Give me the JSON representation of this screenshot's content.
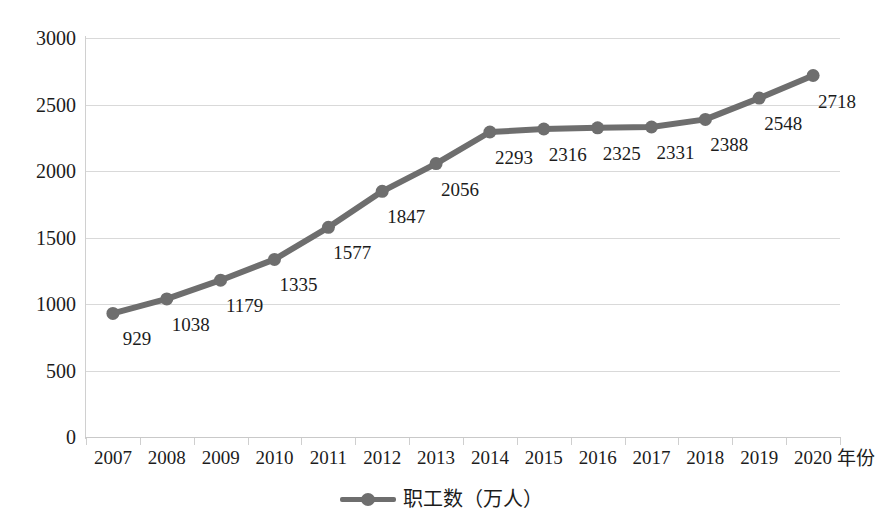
{
  "chart_data": {
    "type": "line",
    "title": "",
    "xlabel": "年份",
    "ylabel": "",
    "categories": [
      "2007",
      "2008",
      "2009",
      "2010",
      "2011",
      "2012",
      "2013",
      "2014",
      "2015",
      "2016",
      "2017",
      "2018",
      "2019",
      "2020"
    ],
    "values": [
      929,
      1038,
      1179,
      1335,
      1577,
      1847,
      2056,
      2293,
      2316,
      2325,
      2331,
      2388,
      2548,
      2718
    ],
    "series": [
      {
        "name": "职工数（万人）",
        "values": [
          929,
          1038,
          1179,
          1335,
          1577,
          1847,
          2056,
          2293,
          2316,
          2325,
          2331,
          2388,
          2548,
          2718
        ]
      }
    ],
    "data_labels": [
      "929",
      "1038",
      "1179",
      "1335",
      "1577",
      "1847",
      "2056",
      "2293",
      "2316",
      "2325",
      "2331",
      "2388",
      "2548",
      "2718"
    ],
    "ylim": [
      0,
      3000
    ],
    "y_ticks": [
      0,
      500,
      1000,
      1500,
      2000,
      2500,
      3000
    ],
    "y_tick_labels": [
      "0",
      "500",
      "1000",
      "1500",
      "2000",
      "2500",
      "3000"
    ],
    "grid": true,
    "legend_position": "bottom",
    "series_color": "#6e6e6e",
    "gridline_color": "#d9d9d9",
    "axis_color": "#c9c9c9",
    "text_color": "#1c1c1c"
  },
  "legend": {
    "entries": [
      {
        "label": "职工数（万人）",
        "marker": "line-with-circle-marker"
      }
    ]
  },
  "axes": {
    "x_unit_label": "年份"
  }
}
